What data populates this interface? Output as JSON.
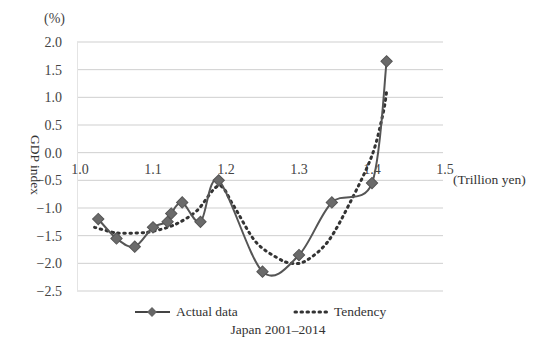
{
  "chart_data": {
    "type": "line",
    "title": "Japan 2001–2014",
    "xlabel": "(Trillion yen)",
    "ylabel": "GDP index",
    "yunit": "(%)",
    "xlim": [
      1.0,
      1.5
    ],
    "ylim": [
      -2.5,
      2.0
    ],
    "x_ticks": [
      "1.0",
      "1.1",
      "1.2",
      "1.3",
      "1.4",
      "1.5"
    ],
    "y_ticks": [
      "2.0",
      "1.5",
      "1.0",
      "0.5",
      "0.0",
      "-0.5",
      "-1.0",
      "-1.5",
      "-2.0",
      "-2.5"
    ],
    "grid": "horizontal",
    "legend_position": "bottom",
    "series": [
      {
        "name": "Actual data",
        "style": "solid-diamond",
        "color": "#555555",
        "points": [
          [
            1.025,
            -1.2
          ],
          [
            1.05,
            -1.55
          ],
          [
            1.075,
            -1.7
          ],
          [
            1.1,
            -1.35
          ],
          [
            1.12,
            -1.25
          ],
          [
            1.125,
            -1.1
          ],
          [
            1.14,
            -0.9
          ],
          [
            1.165,
            -1.25
          ],
          [
            1.19,
            -0.5
          ],
          [
            1.25,
            -2.15
          ],
          [
            1.3,
            -1.85
          ],
          [
            1.345,
            -0.9
          ],
          [
            1.4,
            -0.55
          ],
          [
            1.42,
            1.65
          ]
        ]
      },
      {
        "name": "Tendency",
        "style": "dotted",
        "color": "#333333",
        "points": [
          [
            1.02,
            -1.35
          ],
          [
            1.05,
            -1.45
          ],
          [
            1.08,
            -1.45
          ],
          [
            1.1,
            -1.42
          ],
          [
            1.13,
            -1.3
          ],
          [
            1.16,
            -1.05
          ],
          [
            1.19,
            -0.6
          ],
          [
            1.21,
            -0.95
          ],
          [
            1.24,
            -1.6
          ],
          [
            1.27,
            -1.9
          ],
          [
            1.29,
            -2.0
          ],
          [
            1.31,
            -1.95
          ],
          [
            1.34,
            -1.6
          ],
          [
            1.37,
            -0.9
          ],
          [
            1.4,
            -0.05
          ],
          [
            1.415,
            0.7
          ],
          [
            1.42,
            1.1
          ]
        ]
      }
    ]
  }
}
